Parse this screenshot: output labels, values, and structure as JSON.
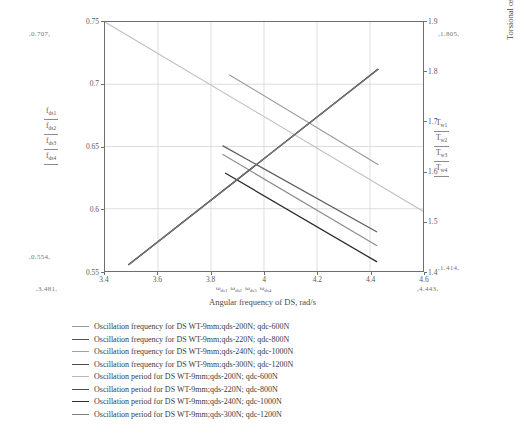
{
  "chart_data": {
    "type": "line",
    "title": "",
    "xlabel": "Angular frequency of DS, rad/s",
    "ylabel": "Torsional oscillation frequency of DS, HZ",
    "y2label": "Torsional oscillation period of DS, s",
    "xlim": [
      3.4,
      4.6
    ],
    "ylim": [
      0.55,
      0.75
    ],
    "y2lim": [
      1.4,
      1.9
    ],
    "grid": true,
    "legend_position": "below",
    "xticks": [
      "3.4",
      "3.6",
      "3.8",
      "4",
      "4.2",
      "4.4",
      "4.6"
    ],
    "xtick_values": [
      3.4,
      3.6,
      3.8,
      4.0,
      4.2,
      4.4,
      4.6
    ],
    "yticks": [
      "0.75",
      "0.7",
      "0.65",
      "0.6",
      "0.55"
    ],
    "ytick_values": [
      0.75,
      0.7,
      0.65,
      0.6,
      0.55
    ],
    "y2ticks": [
      "1.9",
      "1.8",
      "1.7",
      "1.6",
      "1.5",
      "1.4"
    ],
    "y2tick_values": [
      1.9,
      1.8,
      1.7,
      1.6,
      1.5,
      1.4
    ],
    "annotations": {
      "y_top": "0.707",
      "y_bottom": "0.554",
      "x_left": "3.481",
      "x_right": "4.443",
      "y2_top": "1.805",
      "y2_bottom": "1.414"
    },
    "left_symbols": [
      "f_ds1",
      "f_ds2",
      "f_ds3",
      "f_ds4"
    ],
    "right_symbols": [
      "T_w1",
      "T_w2",
      "T_w3",
      "T_w4"
    ],
    "x_symbols": [
      "w_ds1",
      "w_ds2",
      "w_ds3",
      "w_ds4"
    ],
    "series": [
      {
        "name": "Oscillation frequency for DS WT-9mm;qds-200N; qdc-600N",
        "axis": "left",
        "color": "#9a9a9a",
        "width": 1.1,
        "x": [
          3.87,
          4.43
        ],
        "y": [
          0.7075,
          0.6355
        ]
      },
      {
        "name": "Oscillation frequency for DS WT-9mm;qds-220N; qdc-800N",
        "axis": "left",
        "color": "#5c5c5c",
        "width": 1.2,
        "x": [
          3.845,
          4.425
        ],
        "y": [
          0.6505,
          0.5815
        ]
      },
      {
        "name": "Oscillation frequency for DS WT-9mm;qds-240N; qdc-1000N",
        "axis": "left",
        "color": "#8d8d8d",
        "width": 1.2,
        "x": [
          3.845,
          4.425
        ],
        "y": [
          0.6435,
          0.5705
        ]
      },
      {
        "name": "Oscillation frequency for DS WT-9mm;qds-300N; qdc-1200N",
        "axis": "left",
        "color": "#2b2b2b",
        "width": 1.3,
        "x": [
          3.855,
          4.425
        ],
        "y": [
          0.6285,
          0.5575
        ]
      },
      {
        "name": "Oscillation period for DS WT-9mm;qds-200N; qdc-600N",
        "axis": "right",
        "color": "#c2c2c2",
        "width": 1.1,
        "x": [
          3.4,
          4.6
        ],
        "y": [
          1.9,
          1.52
        ]
      },
      {
        "name": "Oscillation period for DS WT-9mm;qds-220N; qdc-800N",
        "axis": "right",
        "color": "#6a6a6a",
        "width": 1.2,
        "x": [
          3.49,
          4.43
        ],
        "y": [
          1.413,
          1.805
        ]
      },
      {
        "name": "Oscillation period for DS WT-9mm;qds-240N; qdc-1000N",
        "axis": "right",
        "color": "#2e2e2e",
        "width": 1.3,
        "x": [
          3.49,
          4.43
        ],
        "y": [
          1.413,
          1.805
        ]
      },
      {
        "name": "Oscillation period for DS WT-9mm;qds-300N; qdc-1200N",
        "axis": "right",
        "color": "#7d7d7d",
        "width": 1.1,
        "x": [
          3.49,
          4.43
        ],
        "y": [
          1.413,
          1.805
        ]
      }
    ]
  },
  "axes": {
    "left_title": "Torsional oscillation frequency of DS, HZ",
    "right_title": "Torsional oscillation period of DS, s",
    "bottom_title": "Angular frequency of DS, rad/s"
  },
  "ticks": {
    "left": [
      "0.75",
      "0.7",
      "0.65",
      "0.6",
      "0.55"
    ],
    "right": [
      "1.9",
      "1.8",
      "1.7",
      "1.6",
      "1.5",
      "1.4"
    ],
    "bottom": [
      "3.4",
      "3.6",
      "3.8",
      "4",
      "4.2",
      "4.4",
      "4.6"
    ]
  },
  "annotations": {
    "top_left": ",0.707,",
    "bottom_left": ",0.554,",
    "x_left": ",3.481,",
    "x_right": ",4.443,",
    "top_right": ",1.805,",
    "bottom_right": ",1.414,"
  },
  "symbols": {
    "left": [
      {
        "base": "f",
        "sub": "ds1"
      },
      {
        "base": "f",
        "sub": "ds2"
      },
      {
        "base": "f",
        "sub": "ds3"
      },
      {
        "base": "f",
        "sub": "ds4"
      }
    ],
    "right": [
      {
        "base": "T",
        "sub": "w1"
      },
      {
        "base": "T",
        "sub": "w2"
      },
      {
        "base": "T",
        "sub": "w3"
      },
      {
        "base": "T",
        "sub": "w4"
      }
    ],
    "bottom": [
      {
        "base": "ω",
        "sub": "ds1"
      },
      {
        "base": "ω",
        "sub": "ds2"
      },
      {
        "base": "ω",
        "sub": "ds3"
      },
      {
        "base": "ω",
        "sub": "ds4"
      }
    ]
  },
  "legend": {
    "items": [
      {
        "label": "Oscillation frequency for DS WT-9mm;qds-200N; qdc-600N",
        "color": "#9a9a9a"
      },
      {
        "label": "Oscillation frequency for DS WT-9mm;qds-220N; qdc-800N",
        "color": "#555555"
      },
      {
        "label": "Oscillation frequency for DS WT-9mm;qds-240N; qdc-1000N",
        "color": "#a2a2a2"
      },
      {
        "label": "Oscillation frequency for DS WT-9mm;qds-300N; qdc-1200N",
        "color": "#4a4a4a"
      },
      {
        "label": "Oscillation period for DS WT-9mm;qds-200N; qdc-600N",
        "color": "#b9b9b9"
      },
      {
        "label": "Oscillation period for DS WT-9mm;qds-220N; qdc-800N",
        "color": "#4f4f4f"
      },
      {
        "label": "Oscillation period for DS WT-9mm;qds-240N; qdc-1000N",
        "color": "#2b2b2b"
      },
      {
        "label": "Oscillation period for DS WT-9mm;qds-300N; qdc-1200N",
        "color": "#808080"
      }
    ]
  }
}
